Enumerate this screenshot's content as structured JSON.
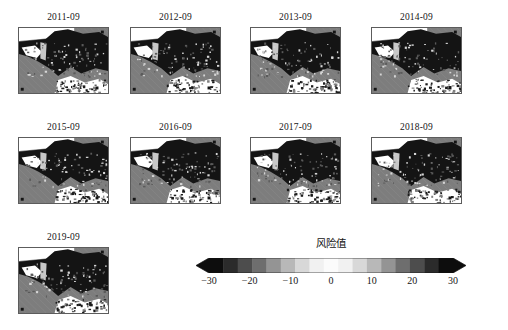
{
  "figure": {
    "kind": "small-multiples-map-grid",
    "panels": [
      {
        "title": "2011-09",
        "row": 0,
        "col": 0
      },
      {
        "title": "2012-09",
        "row": 0,
        "col": 1
      },
      {
        "title": "2013-09",
        "row": 0,
        "col": 2
      },
      {
        "title": "2014-09",
        "row": 0,
        "col": 3
      },
      {
        "title": "2015-09",
        "row": 1,
        "col": 0
      },
      {
        "title": "2016-09",
        "row": 1,
        "col": 1
      },
      {
        "title": "2017-09",
        "row": 1,
        "col": 2
      },
      {
        "title": "2018-09",
        "row": 1,
        "col": 3
      },
      {
        "title": "2019-09",
        "row": 2,
        "col": 0
      }
    ]
  },
  "chart_data": {
    "type": "heatmap",
    "title": "",
    "subtitle": "",
    "xlabel": "",
    "ylabel": "",
    "grid": false,
    "legend_position": "bottom-center",
    "panel_titles": [
      "2011-09",
      "2012-09",
      "2013-09",
      "2014-09",
      "2015-09",
      "2016-09",
      "2017-09",
      "2018-09",
      "2019-09"
    ],
    "panel_layout": {
      "rows": 3,
      "cols": 4,
      "filled": 9
    },
    "colorbar": {
      "label": "风险值",
      "tick_labels": [
        "−30",
        "−20",
        "−10",
        "0",
        "10",
        "20",
        "30"
      ],
      "tick_values": [
        -30,
        -20,
        -10,
        0,
        10,
        20,
        30
      ],
      "vmin": -30,
      "vmax": 30,
      "extend": "both",
      "orientation": "horizontal",
      "colormap": "grayscale-diverging",
      "band_colors": [
        "#0d0d0d",
        "#2b2b2b",
        "#4d4d4d",
        "#6e6e6e",
        "#949494",
        "#b8b8b8",
        "#d8d8d8",
        "#f1f1f1",
        "#fbfbfb",
        "#f1f1f1",
        "#d8d8d8",
        "#b8b8b8",
        "#949494",
        "#6e6e6e",
        "#4d4d4d",
        "#2b2b2b",
        "#0d0d0d"
      ],
      "cap_color": "#0d0d0d"
    },
    "map_colors": {
      "ocean_background": "#7d7d7d",
      "land_mask": "#141414",
      "high_value": "#ffffff",
      "frame": "#5c5c5c"
    }
  }
}
